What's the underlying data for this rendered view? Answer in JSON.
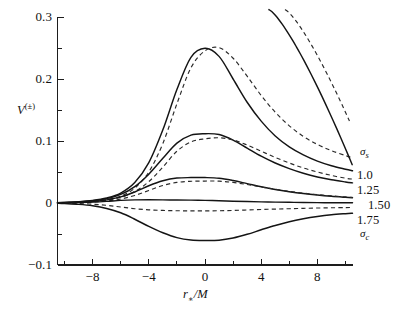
{
  "figure": {
    "name": "effective-potential-plot",
    "background": "#ffffff",
    "ink_color": "#141414"
  },
  "axes": {
    "y_title_main": "V",
    "y_title_sup": "(±)",
    "x_title_main": "r",
    "x_title_sub": "∗",
    "x_title_tail": "/M",
    "y_ticks": [
      {
        "value": 0.3,
        "label": "0.3"
      },
      {
        "value": 0.25,
        "label": ""
      },
      {
        "value": 0.2,
        "label": "0.2"
      },
      {
        "value": 0.15,
        "label": ""
      },
      {
        "value": 0.1,
        "label": "0.1"
      },
      {
        "value": 0.05,
        "label": ""
      },
      {
        "value": 0.0,
        "label": "0"
      },
      {
        "value": -0.05,
        "label": ""
      },
      {
        "value": -0.1,
        "label": "−0.1"
      }
    ],
    "x_ticks": [
      {
        "value": -10,
        "label": ""
      },
      {
        "value": -8,
        "label": "−8"
      },
      {
        "value": -6,
        "label": ""
      },
      {
        "value": -4,
        "label": "−4"
      },
      {
        "value": -2,
        "label": ""
      },
      {
        "value": 0,
        "label": "0"
      },
      {
        "value": 2,
        "label": ""
      },
      {
        "value": 4,
        "label": "4"
      },
      {
        "value": 6,
        "label": ""
      },
      {
        "value": 8,
        "label": "8"
      },
      {
        "value": 10,
        "label": ""
      }
    ]
  },
  "curve_labels": [
    {
      "id": "sigma-s",
      "text": "σ",
      "sub": "s",
      "kind": "symbol"
    },
    {
      "id": "sigma-1-00",
      "text": "1.0",
      "sub": "",
      "kind": "number"
    },
    {
      "id": "sigma-1-25",
      "text": "1.25",
      "sub": "",
      "kind": "number"
    },
    {
      "id": "sigma-1-50",
      "text": "1.50",
      "sub": "",
      "kind": "number"
    },
    {
      "id": "sigma-1-75",
      "text": "1.75",
      "sub": "",
      "kind": "number"
    },
    {
      "id": "sigma-c",
      "text": "σ",
      "sub": "c",
      "kind": "symbol"
    }
  ],
  "chart_data": {
    "type": "line",
    "title": "",
    "xlabel": "r_*/M",
    "ylabel": "V^(±)",
    "xlim": [
      -10.5,
      10.5
    ],
    "ylim": [
      -0.1,
      0.3
    ],
    "grid": false,
    "legend_position": "right-inline",
    "x": [
      -10.5,
      -10,
      -9,
      -8,
      -7,
      -6,
      -5,
      -4,
      -3,
      -2,
      -1,
      0,
      1,
      2,
      3,
      4,
      5,
      6,
      7,
      8,
      9,
      10,
      10.5
    ],
    "series": [
      {
        "name": "σ_s",
        "label": "σ_s",
        "style": "solid",
        "peak_value": 0.25,
        "peak_x": -0.2,
        "values": [
          0.0005,
          0.001,
          0.002,
          0.004,
          0.008,
          0.016,
          0.033,
          0.065,
          0.118,
          0.183,
          0.235,
          0.2495,
          0.2365,
          0.2,
          0.1625,
          0.132,
          0.108,
          0.0905,
          0.0775,
          0.0675,
          0.06,
          0.0545,
          0.052
        ]
      },
      {
        "name": "σ_s-dashed",
        "label": "σ_s",
        "style": "dashed",
        "peak_value": 0.251,
        "peak_x": 0.9,
        "values": [
          0.0003,
          0.0006,
          0.0013,
          0.0027,
          0.0055,
          0.0112,
          0.024,
          0.05,
          0.096,
          0.16,
          0.218,
          0.2455,
          0.2505,
          0.2335,
          0.2045,
          0.1735,
          0.1465,
          0.1245,
          0.1075,
          0.0945,
          0.0845,
          0.0765,
          0.073
        ]
      },
      {
        "name": "1.0",
        "label": "1.0",
        "style": "solid",
        "peak_value": 0.112,
        "peak_x": 0.2,
        "values": [
          0.0004,
          0.0008,
          0.0017,
          0.0035,
          0.007,
          0.0138,
          0.0265,
          0.0465,
          0.072,
          0.0965,
          0.1095,
          0.1118,
          0.1105,
          0.1015,
          0.0885,
          0.0755,
          0.0645,
          0.0555,
          0.048,
          0.042,
          0.0375,
          0.034,
          0.0325
        ]
      },
      {
        "name": "1.0-dashed",
        "label": "1.0",
        "style": "dashed",
        "peak_value": 0.1055,
        "peak_x": 1.6,
        "values": [
          0.0002,
          0.0005,
          0.001,
          0.0022,
          0.0045,
          0.0092,
          0.0185,
          0.0345,
          0.058,
          0.0835,
          0.0985,
          0.1035,
          0.1052,
          0.1018,
          0.0935,
          0.0835,
          0.0735,
          0.0645,
          0.0565,
          0.05,
          0.0445,
          0.04,
          0.0385
        ]
      },
      {
        "name": "1.25",
        "label": "1.25",
        "style": "solid",
        "peak_value": 0.041,
        "peak_x": 0.1,
        "values": [
          0.0003,
          0.0006,
          0.0012,
          0.0025,
          0.005,
          0.0098,
          0.0178,
          0.0278,
          0.0358,
          0.0402,
          0.041,
          0.041,
          0.04,
          0.0362,
          0.0312,
          0.0262,
          0.0218,
          0.0182,
          0.0152,
          0.0128,
          0.0108,
          0.0092,
          0.0085
        ]
      },
      {
        "name": "1.25-dashed",
        "label": "1.25",
        "style": "dashed",
        "peak_value": 0.0355,
        "peak_x": 1.4,
        "values": [
          0.0001,
          0.0003,
          0.0007,
          0.0015,
          0.0032,
          0.0065,
          0.0122,
          0.0202,
          0.0282,
          0.0332,
          0.035,
          0.0354,
          0.0352,
          0.0332,
          0.0298,
          0.0258,
          0.0222,
          0.0188,
          0.0158,
          0.0135,
          0.0115,
          0.0098,
          0.009
        ]
      },
      {
        "name": "1.50",
        "label": "1.50",
        "style": "solid",
        "peak_value": 0.005,
        "peak_x": -0.8,
        "values": [
          0.0002,
          0.0003,
          0.0007,
          0.0014,
          0.0026,
          0.0042,
          0.005,
          0.0052,
          0.005,
          0.0048,
          0.0046,
          0.0042,
          0.0036,
          0.0029,
          0.0023,
          0.0018,
          0.0014,
          0.0011,
          0.0008,
          0.0006,
          0.0005,
          0.0004,
          0.0003
        ]
      },
      {
        "name": "1.75",
        "label": "1.75",
        "style": "dashed",
        "peak_value": -0.012,
        "peak_x": 0.0,
        "values": [
          -0.0002,
          -0.0004,
          -0.0009,
          -0.0019,
          -0.0038,
          -0.0065,
          -0.0092,
          -0.011,
          -0.012,
          -0.0125,
          -0.0127,
          -0.0127,
          -0.0125,
          -0.012,
          -0.0113,
          -0.0105,
          -0.0098,
          -0.0092,
          -0.0086,
          -0.0081,
          -0.0077,
          -0.0074,
          -0.0072
        ]
      },
      {
        "name": "σ_c",
        "label": "σ_c",
        "style": "solid",
        "peak_value": -0.0605,
        "peak_x": 0.3,
        "values": [
          -0.0005,
          -0.001,
          -0.0022,
          -0.0045,
          -0.0088,
          -0.0158,
          -0.0262,
          -0.0378,
          -0.048,
          -0.0558,
          -0.0598,
          -0.0605,
          -0.06,
          -0.0565,
          -0.0505,
          -0.0432,
          -0.0362,
          -0.0302,
          -0.0255,
          -0.0218,
          -0.019,
          -0.0172,
          -0.0165
        ]
      },
      {
        "name": "steep-solid",
        "label": "steep rising branch (solid)",
        "style": "solid",
        "peak_value": 0.3,
        "peak_x": 4.6,
        "note": "inner branch rising off top of frame near r*/M = 4.6"
      },
      {
        "name": "steep-dashed",
        "label": "steep rising branch (dashed)",
        "style": "dashed",
        "peak_value": 0.3,
        "peak_x": 5.7,
        "note": "outer branch rising off top of frame near r*/M = 5.7"
      }
    ]
  }
}
